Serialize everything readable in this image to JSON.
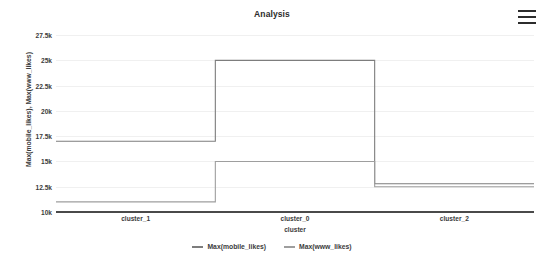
{
  "header": {
    "title": "Analysis",
    "menu_icon": "hamburger-menu-icon"
  },
  "colors": {
    "series_mobile": "#7d7d7d",
    "series_www": "#9e9e9e",
    "gridline": "#f0f0f0",
    "axis": "#4a4a4a",
    "text": "#3b3b3b",
    "background": "#ffffff"
  },
  "legend": {
    "position": "bottom",
    "entries": [
      {
        "label": "Max(mobile_likes)",
        "color": "#7d7d7d"
      },
      {
        "label": "Max(www_likes)",
        "color": "#9e9e9e"
      }
    ]
  },
  "chart_data": {
    "type": "line",
    "line_style": "step",
    "title": "Analysis",
    "xlabel": "cluster",
    "ylabel": "Max(mobile_likes), Max(www_likes)",
    "categories": [
      "cluster_1",
      "cluster_0",
      "cluster_2"
    ],
    "ylim": [
      10000,
      28500
    ],
    "yticks": [
      10000,
      12500,
      15000,
      17500,
      20000,
      22500,
      25000,
      27500
    ],
    "ytick_labels": [
      "10k",
      "12.5k",
      "15k",
      "17.5k",
      "20k",
      "22.5k",
      "25k",
      "27.5k"
    ],
    "grid": true,
    "series": [
      {
        "name": "Max(mobile_likes)",
        "color": "#7d7d7d",
        "values": [
          17000,
          25000,
          12800
        ]
      },
      {
        "name": "Max(www_likes)",
        "color": "#9e9e9e",
        "values": [
          11000,
          15000,
          12500
        ]
      }
    ]
  }
}
